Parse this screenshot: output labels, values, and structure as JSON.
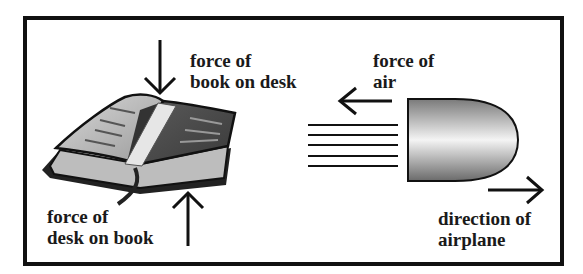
{
  "diagram": {
    "book_panel": {
      "object": "open book on desk",
      "force_down_label": [
        "force of",
        "book on desk"
      ],
      "force_up_label": [
        "force of",
        "desk on book"
      ]
    },
    "airplane_panel": {
      "object": "airplane nose (bullet shape)",
      "air_force_label": [
        "force of",
        "air"
      ],
      "direction_label": [
        "direction of",
        "airplane"
      ],
      "air_lines_count": 5
    },
    "colors": {
      "line": "#111111",
      "shape_dark": "#6e6e6e",
      "shape_light": "#f2f2f2"
    }
  }
}
